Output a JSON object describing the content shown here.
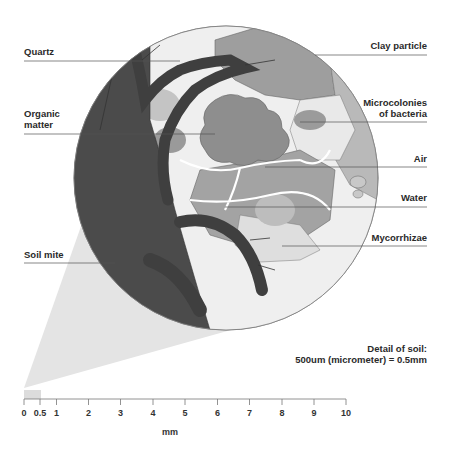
{
  "figure": {
    "title": "Detail of soil",
    "caption_line1": "Detail of soil:",
    "caption_line2": "500um (micrometer) = 0.5mm"
  },
  "labels_left": [
    {
      "id": "quartz",
      "text": "Quartz"
    },
    {
      "id": "organic-matter",
      "line1": "Organic",
      "line2": "matter"
    },
    {
      "id": "soil-mite",
      "text": "Soil mite"
    }
  ],
  "labels_right": [
    {
      "id": "clay-particle",
      "text": "Clay particle"
    },
    {
      "id": "microcolonies",
      "line1": "Microcolonies",
      "line2": "of bacteria"
    },
    {
      "id": "air",
      "text": "Air"
    },
    {
      "id": "water",
      "text": "Water"
    },
    {
      "id": "mycorrhizae",
      "text": "Mycorrhizae"
    }
  ],
  "scale_bar": {
    "ticks": [
      "0",
      "0.5",
      "1",
      "2",
      "3",
      "4",
      "5",
      "6",
      "7",
      "8",
      "9",
      "10"
    ],
    "unit": "mm",
    "highlight_range": "0–0.5"
  },
  "colors": {
    "mite": "#4a4a4a",
    "clay": "#9a9a9a",
    "organic": "#8a8a8a",
    "light_fill": "#e6e6e6",
    "cone": "#e3e3e3",
    "leader_line": "#555555"
  }
}
